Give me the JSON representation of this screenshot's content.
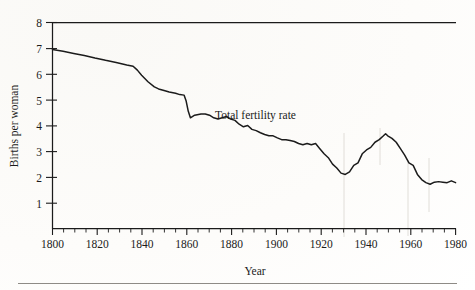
{
  "figure": {
    "background_color": "#fefefe",
    "ink_color": "#1b1b1b",
    "series_color": "#1b1b1b"
  },
  "axes": {
    "x_title": "Year",
    "y_title": "Births per woman",
    "x_ticks": [
      "1800",
      "1820",
      "1840",
      "1860",
      "1880",
      "1900",
      "1920",
      "1940",
      "1960",
      "1980"
    ],
    "y_ticks": [
      "8",
      "7",
      "6",
      "5",
      "4",
      "3",
      "2",
      "1"
    ]
  },
  "annotations": {
    "series_label": "Total fertility rate"
  },
  "chart_data": {
    "type": "line",
    "title": "",
    "xlabel": "Year",
    "ylabel": "Births per woman",
    "xlim": [
      1800,
      1990
    ],
    "ylim": [
      0,
      8
    ],
    "grid": false,
    "legend_position": "inline-annotation",
    "x_major_tick_step": 20,
    "x_minor_tick_step": 5,
    "y_major_tick_step": 1,
    "series": [
      {
        "name": "Total fertility rate",
        "color": "#1b1b1b",
        "x": [
          1800,
          1805,
          1810,
          1815,
          1820,
          1825,
          1830,
          1835,
          1838,
          1840,
          1842,
          1845,
          1848,
          1850,
          1853,
          1855,
          1858,
          1860,
          1862,
          1863,
          1864,
          1865,
          1867,
          1870,
          1872,
          1874,
          1876,
          1878,
          1880,
          1882,
          1884,
          1886,
          1888,
          1890,
          1892,
          1894,
          1896,
          1898,
          1900,
          1902,
          1904,
          1906,
          1908,
          1910,
          1912,
          1914,
          1916,
          1918,
          1920,
          1922,
          1924,
          1926,
          1928,
          1930,
          1932,
          1934,
          1936,
          1938,
          1940,
          1942,
          1944,
          1946,
          1948,
          1950,
          1952,
          1954,
          1956,
          1957,
          1958,
          1960,
          1962,
          1964,
          1966,
          1968,
          1970,
          1972,
          1974,
          1976,
          1978,
          1980,
          1982,
          1984,
          1986,
          1988,
          1990
        ],
        "y": [
          6.95,
          6.88,
          6.8,
          6.72,
          6.62,
          6.53,
          6.45,
          6.35,
          6.3,
          6.15,
          5.95,
          5.7,
          5.5,
          5.42,
          5.35,
          5.3,
          5.25,
          5.2,
          5.18,
          4.95,
          4.55,
          4.3,
          4.4,
          4.45,
          4.45,
          4.4,
          4.3,
          4.25,
          4.3,
          4.35,
          4.25,
          4.2,
          4.05,
          3.95,
          4.0,
          3.85,
          3.8,
          3.72,
          3.65,
          3.6,
          3.6,
          3.52,
          3.45,
          3.45,
          3.42,
          3.38,
          3.3,
          3.25,
          3.3,
          3.25,
          3.3,
          3.1,
          2.9,
          2.75,
          2.5,
          2.35,
          2.15,
          2.1,
          2.2,
          2.45,
          2.55,
          2.9,
          3.05,
          3.15,
          3.35,
          3.45,
          3.6,
          3.68,
          3.6,
          3.5,
          3.35,
          3.1,
          2.85,
          2.55,
          2.45,
          2.1,
          1.9,
          1.78,
          1.72,
          1.8,
          1.82,
          1.8,
          1.78,
          1.85,
          1.78
        ],
        "start_value": 6.95,
        "end_value": 1.78,
        "max_value": 3.68,
        "max_value_year": 1957,
        "min_value": 1.72,
        "min_value_year": 1976
      }
    ]
  }
}
